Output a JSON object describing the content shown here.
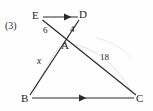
{
  "figure": {
    "item_number": "(3)",
    "vertices": [
      {
        "name": "E",
        "label": "E",
        "x": 37,
        "y": 16
      },
      {
        "name": "D",
        "label": "D",
        "x": 82,
        "y": 15
      },
      {
        "name": "A",
        "label": "A",
        "x": 66,
        "y": 39
      },
      {
        "name": "B",
        "label": "B",
        "x": 27,
        "y": 99
      },
      {
        "name": "C",
        "label": "C",
        "x": 139,
        "y": 99
      }
    ],
    "segment_labels": [
      {
        "name": "EA",
        "label": "6",
        "x": 47,
        "y": 30
      },
      {
        "name": "AD",
        "label": "4",
        "x": 72,
        "y": 29
      },
      {
        "name": "AB",
        "label": "x",
        "x": 40,
        "y": 61
      },
      {
        "name": "AC",
        "label": "18",
        "x": 104,
        "y": 57
      }
    ],
    "colors": {
      "line": "#2b2b2b",
      "arc": "#d8d8d8",
      "text": "#232323",
      "background": "#fefefe"
    },
    "edges": [
      {
        "name": "ED",
        "from": "E",
        "to": "D",
        "arrow": true
      },
      {
        "name": "BC",
        "from": "B",
        "to": "C",
        "arrow": true
      },
      {
        "name": "EC",
        "from": "E",
        "to": "C",
        "arrow": false
      },
      {
        "name": "DB",
        "from": "D",
        "to": "B",
        "arrow": false
      }
    ]
  }
}
